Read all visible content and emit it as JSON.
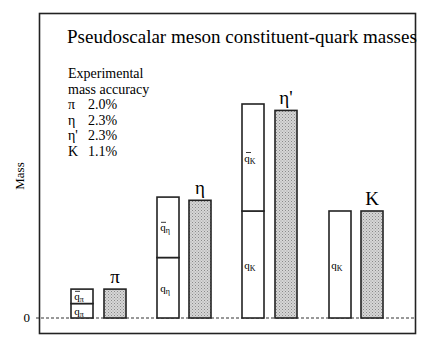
{
  "chart_data": {
    "type": "bar",
    "title": "Pseudoscalar meson constituent-quark masses",
    "xlabel": "",
    "ylabel": "Mass",
    "y_ticks": [
      "0"
    ],
    "ylim": [
      0,
      2.2
    ],
    "grid": false,
    "units_note": "arbitrary units, normalized so the K-sector constituent quark = 1.0",
    "legend": {
      "placement": "top-left",
      "heading": [
        "Experimental",
        "mass accuracy"
      ],
      "entries": [
        {
          "symbol": "π",
          "value": "2.0%"
        },
        {
          "symbol": "η",
          "value": "2.3%"
        },
        {
          "symbol": "η'",
          "value": "2.3%"
        },
        {
          "symbol": "K",
          "value": "1.1%"
        }
      ]
    },
    "groups": [
      {
        "meson": "π",
        "quark_stack": [
          {
            "label": "q",
            "sub": "π",
            "bar": false,
            "value": 0.135
          },
          {
            "label": "q",
            "sub": "π",
            "bar": true,
            "value": 0.135
          }
        ],
        "meson_mass": 0.27
      },
      {
        "meson": "η",
        "quark_stack": [
          {
            "label": "q",
            "sub": "η",
            "bar": false,
            "value": 0.565
          },
          {
            "label": "q",
            "sub": "η",
            "bar": true,
            "value": 0.565
          }
        ],
        "meson_mass": 1.1
      },
      {
        "meson": "η'",
        "quark_stack": [
          {
            "label": "q",
            "sub": "K",
            "bar": false,
            "value": 1.0
          },
          {
            "label": "q",
            "sub": "K",
            "bar": true,
            "value": 1.0
          }
        ],
        "meson_mass": 1.94
      },
      {
        "meson": "K",
        "quark_stack": [
          {
            "label": "q",
            "sub": "K",
            "bar": false,
            "value": 1.0
          }
        ],
        "meson_mass": 1.0
      }
    ]
  }
}
